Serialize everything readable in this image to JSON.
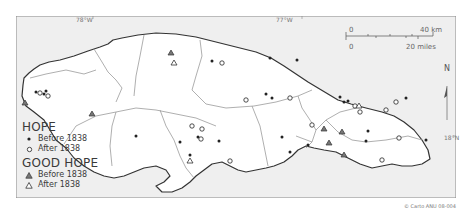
{
  "map": {
    "title": "Jamaica: Hope and Good Hope estates",
    "graticule": {
      "lon_78": "78°W",
      "lon_77": "77°W",
      "lat_18": "18°N"
    },
    "scale_bar": {
      "km_zero": "0",
      "km_max": "40 km",
      "mi_zero": "0",
      "mi_max": "20 miles"
    },
    "north_arrow": "N",
    "credit": "© Carto ANU 08-004",
    "colors": {
      "sea": "#eeeeee",
      "land": "#ffffff",
      "coast": "#333333",
      "parish_border": "#999999",
      "frame": "#888888",
      "marker": "#222222",
      "triangle_fill": "#777777"
    }
  },
  "legend": {
    "hope": {
      "title": "HOPE",
      "before": "Before 1838",
      "after": "After 1838"
    },
    "good_hope": {
      "title": "GOOD HOPE",
      "before": "Before 1838",
      "after": "After 1838"
    }
  }
}
